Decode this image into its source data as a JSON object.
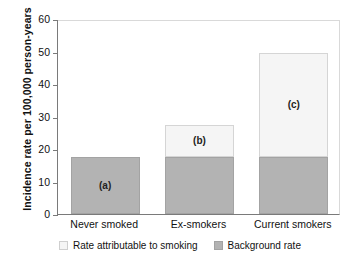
{
  "chart_data": {
    "type": "bar",
    "subtype": "stacked-bar",
    "title": "",
    "xlabel": "",
    "ylabel": "Incidence rate per 100,000 person-years",
    "categories": [
      "Never smoked",
      "Ex-smokers",
      "Current smokers"
    ],
    "ylim": [
      0,
      60
    ],
    "yticks": [
      0,
      10,
      20,
      30,
      40,
      50,
      60
    ],
    "ytick_labels": [
      "0",
      "10",
      "20",
      "30",
      "40",
      "50",
      "60"
    ],
    "grid": false,
    "legend_position": "bottom",
    "series": [
      {
        "name": "Background rate",
        "color": "#b3b3b3",
        "values": [
          17.5,
          17.5,
          17.5
        ]
      },
      {
        "name": "Rate attributable to smoking",
        "color": "#f5f5f5",
        "values": [
          0,
          10,
          32
        ]
      }
    ],
    "totals": [
      17.5,
      27.5,
      49.5
    ],
    "annotations": [
      "(a)",
      "(b)",
      "(c)"
    ]
  },
  "legend": {
    "items": [
      {
        "label": "Rate attributable to smoking",
        "swatch": "light-swatch"
      },
      {
        "label": "Background rate",
        "swatch": "grey-swatch"
      }
    ]
  }
}
